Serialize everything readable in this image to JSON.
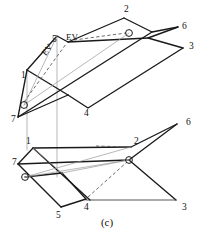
{
  "figure": {
    "caption": "(c)",
    "width": 207,
    "height": 232,
    "background_color": "#ffffff",
    "line_color": "#1a1a1a",
    "light_line_color": "#9a9a9a",
    "dashed_line_color": "#5a5a5a"
  },
  "upper_view": {
    "name": "top-view",
    "vertex_labels": [
      {
        "text": "2",
        "x": 124,
        "y": 10
      },
      {
        "text": "6",
        "x": 182,
        "y": 27
      },
      {
        "text": "3",
        "x": 189,
        "y": 47
      },
      {
        "text": "5",
        "x": 55,
        "y": 40
      },
      {
        "text": "1",
        "x": 23,
        "y": 76
      },
      {
        "text": "7",
        "x": 13,
        "y": 119
      },
      {
        "text": "4",
        "x": 84,
        "y": 113
      }
    ],
    "annotations": [
      {
        "text": "EV",
        "x": 68,
        "y": 38,
        "rotation": 0
      },
      {
        "text": "EV",
        "x": 46,
        "y": 53,
        "rotation": -52
      }
    ],
    "markers": [
      {
        "name": "pierce-point-right",
        "x": 129,
        "y": 33,
        "r": 3.4
      },
      {
        "name": "pierce-point-left",
        "x": 24,
        "y": 105,
        "r": 3.4
      }
    ]
  },
  "lower_view": {
    "name": "front-view",
    "vertex_labels": [
      {
        "text": "6",
        "x": 188,
        "y": 124
      },
      {
        "text": "2",
        "x": 135,
        "y": 143
      },
      {
        "text": "1",
        "x": 27,
        "y": 142
      },
      {
        "text": "7",
        "x": 14,
        "y": 163
      },
      {
        "text": "5",
        "x": 57,
        "y": 213
      },
      {
        "text": "4",
        "x": 85,
        "y": 206
      },
      {
        "text": "3",
        "x": 184,
        "y": 207
      }
    ],
    "markers": [
      {
        "name": "pierce-point-left-front",
        "x": 25,
        "y": 177,
        "r": 3.4
      },
      {
        "name": "pierce-point-right-front",
        "x": 129,
        "y": 160,
        "r": 3.4
      }
    ]
  },
  "geometry": {
    "upper_solid_paths": [
      "M 124 18 L 68 42 L 57 36 L 27 70",
      "M 124 18 L 152 32 L 178 27",
      "M 178 27 L 148 38 L 183 48",
      "M 183 48 L 88 108 L 68 95",
      "M 68 95 L 18 117",
      "M 18 117 L 27 70",
      "M 68 42 L 148 38",
      "M 18 117 L 152 32",
      "M 27 70 L 68 95"
    ],
    "upper_dashed_paths": [
      "M 72 40 L 129 33",
      "M 24 105 L 68 42"
    ],
    "upper_light_paths": [
      "M 24 105 L 57 36",
      "M 24 105 L 129 33"
    ],
    "lower_solid_paths": [
      "M 177 124 L 129 160 L 18 164",
      "M 18 164 L 33 148",
      "M 33 148 L 131 147",
      "M 131 147 L 177 124",
      "M 129 160 L 176 200",
      "M 176 200 L 63 200",
      "M 63 200 L 90 200",
      "M 18 164 L 61 207",
      "M 61 207 L 86 198",
      "M 86 198 L 62 173",
      "M 62 173 L 25 177",
      "M 33 148 L 90 200"
    ],
    "lower_dashed_paths": [
      "M 92 146 L 131 147",
      "M 86 198 L 129 160"
    ],
    "lower_light_paths": [
      "M 25 177 L 131 147",
      "M 25 177 L 129 160",
      "M 33 148 L 62 173",
      "M 62 173 L 129 160"
    ],
    "projection_lines": [
      "M 57 36 L 57 177",
      "M 27 70 L 27 148"
    ]
  }
}
